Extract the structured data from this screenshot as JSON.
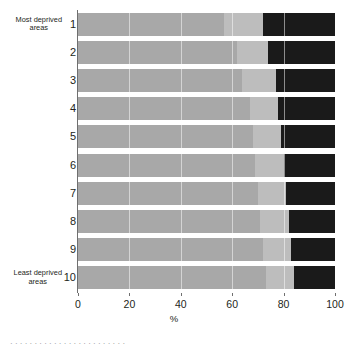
{
  "chart_data": {
    "type": "bar",
    "title": "",
    "subtitle": "",
    "orientation": "horizontal",
    "stacked": true,
    "stack_total": 100,
    "xlabel": "%",
    "ylabel": "",
    "xlim": [
      0,
      100
    ],
    "xticks": [
      0,
      20,
      40,
      60,
      80,
      100
    ],
    "xtick_labels": [
      "0",
      "20",
      "40",
      "60",
      "80",
      "100"
    ],
    "grid": true,
    "legend": "none",
    "categories": [
      "1",
      "2",
      "3",
      "4",
      "5",
      "6",
      "7",
      "8",
      "9",
      "10"
    ],
    "category_end_labels": {
      "first": "Most deprived\nareas",
      "last": "Least deprived\nareas"
    },
    "series": [
      {
        "name": "segment-1",
        "color": "#a8a8a8",
        "values": [
          57,
          62,
          64,
          67,
          68,
          69,
          70,
          71,
          72,
          73
        ]
      },
      {
        "name": "segment-2",
        "color": "#bdbdbd",
        "values": [
          15,
          12,
          13,
          11,
          11,
          11,
          11,
          11,
          11,
          11
        ]
      },
      {
        "name": "segment-3",
        "color": "#1a1a1a",
        "values": [
          28,
          26,
          23,
          22,
          21,
          20,
          19,
          18,
          17,
          16
        ]
      }
    ]
  },
  "caption": {
    "fragment": "· · ·  · · ·   · · ·  · · ·  · · ·   · · ·   · · ·  · · ·"
  }
}
